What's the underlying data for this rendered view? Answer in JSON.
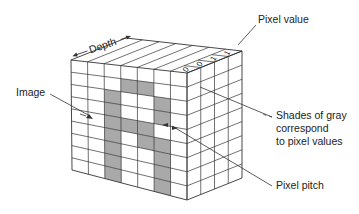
{
  "labels": {
    "depth": "Depth",
    "pixel_value": "Pixel value",
    "image": "Image",
    "shades_line1": "Shades of gray",
    "shades_line2": "correspond",
    "shades_line3": "to pixel values",
    "pixel_pitch": "Pixel pitch"
  },
  "pixel_values": [
    "0",
    "0",
    "1",
    "1"
  ],
  "grid": {
    "columns": 7,
    "rows": 9,
    "depth_cells": 4,
    "pattern": [
      [
        0,
        0,
        0,
        0,
        0,
        0,
        0
      ],
      [
        0,
        0,
        0,
        1,
        1,
        0,
        0
      ],
      [
        0,
        0,
        1,
        0,
        0,
        1,
        0
      ],
      [
        0,
        0,
        1,
        0,
        0,
        1,
        0
      ],
      [
        0,
        0,
        1,
        1,
        1,
        0,
        0
      ],
      [
        0,
        0,
        1,
        0,
        1,
        1,
        0
      ],
      [
        0,
        0,
        1,
        0,
        0,
        1,
        0
      ],
      [
        0,
        0,
        1,
        0,
        0,
        1,
        0
      ],
      [
        0,
        0,
        1,
        0,
        0,
        1,
        0
      ]
    ]
  },
  "colors": {
    "gray_cell": "#a9a9a9",
    "line": "#333333",
    "background": "#ffffff"
  }
}
